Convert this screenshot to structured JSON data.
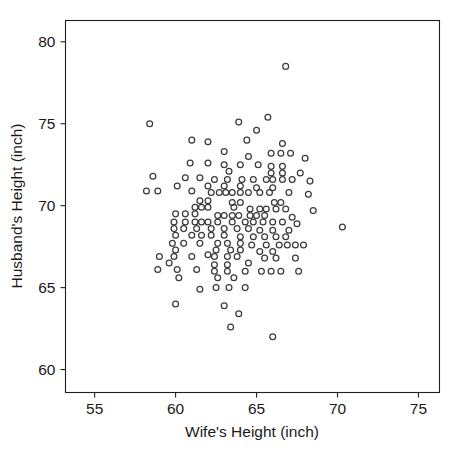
{
  "figure": {
    "clipped_header_text": "",
    "background_color": "#ffffff",
    "marker_color": "#3a3a40",
    "axis_color": "#1f1f1f"
  },
  "chart_data": {
    "type": "scatter",
    "title": "",
    "xlabel": "Wife's Height (inch)",
    "ylabel": "Husband's Height (inch)",
    "xlim": [
      53.2,
      76.3
    ],
    "ylim": [
      58.6,
      81.3
    ],
    "xticks": [
      55,
      60,
      65,
      70,
      75
    ],
    "yticks": [
      60,
      65,
      70,
      75,
      80
    ],
    "xtick_labels": [
      "55",
      "60",
      "65",
      "70",
      "75"
    ],
    "ytick_labels": [
      "60",
      "65",
      "70",
      "75",
      "80"
    ],
    "grid": false,
    "legend": null,
    "marker": "open-circle",
    "n_points": 169,
    "points": [
      [
        66.8,
        78.5
      ],
      [
        58.4,
        75.0
      ],
      [
        63.9,
        75.1
      ],
      [
        65.7,
        75.4
      ],
      [
        65.0,
        74.6
      ],
      [
        64.4,
        74.0
      ],
      [
        61.0,
        74.0
      ],
      [
        62.0,
        73.9
      ],
      [
        66.6,
        73.8
      ],
      [
        63.0,
        73.3
      ],
      [
        65.9,
        73.2
      ],
      [
        66.5,
        73.2
      ],
      [
        67.1,
        73.2
      ],
      [
        64.5,
        73.0
      ],
      [
        68.0,
        72.9
      ],
      [
        60.9,
        72.6
      ],
      [
        62.0,
        72.6
      ],
      [
        63.0,
        72.5
      ],
      [
        64.0,
        72.5
      ],
      [
        65.1,
        72.5
      ],
      [
        65.9,
        72.4
      ],
      [
        66.6,
        72.4
      ],
      [
        63.3,
        72.1
      ],
      [
        65.9,
        72.0
      ],
      [
        66.6,
        72.0
      ],
      [
        67.7,
        72.0
      ],
      [
        58.6,
        71.8
      ],
      [
        60.6,
        71.7
      ],
      [
        61.5,
        71.7
      ],
      [
        62.4,
        71.6
      ],
      [
        63.2,
        71.6
      ],
      [
        64.1,
        71.6
      ],
      [
        64.8,
        71.6
      ],
      [
        65.6,
        71.6
      ],
      [
        66.0,
        71.6
      ],
      [
        66.6,
        71.6
      ],
      [
        67.2,
        71.6
      ],
      [
        68.3,
        71.5
      ],
      [
        60.1,
        71.2
      ],
      [
        62.0,
        71.2
      ],
      [
        63.0,
        71.2
      ],
      [
        64.0,
        71.2
      ],
      [
        65.0,
        71.1
      ],
      [
        66.0,
        71.1
      ],
      [
        58.2,
        70.9
      ],
      [
        58.9,
        70.9
      ],
      [
        61.0,
        70.9
      ],
      [
        62.2,
        70.8
      ],
      [
        62.7,
        70.8
      ],
      [
        63.1,
        70.8
      ],
      [
        63.5,
        70.8
      ],
      [
        64.0,
        70.8
      ],
      [
        64.5,
        70.8
      ],
      [
        65.2,
        70.8
      ],
      [
        65.8,
        70.8
      ],
      [
        67.0,
        70.8
      ],
      [
        68.2,
        70.7
      ],
      [
        61.5,
        70.3
      ],
      [
        62.0,
        70.3
      ],
      [
        63.5,
        70.2
      ],
      [
        66.1,
        70.2
      ],
      [
        66.5,
        70.2
      ],
      [
        61.2,
        69.9
      ],
      [
        61.6,
        69.9
      ],
      [
        62.0,
        69.9
      ],
      [
        63.6,
        69.9
      ],
      [
        64.6,
        69.8
      ],
      [
        65.2,
        69.8
      ],
      [
        65.6,
        69.8
      ],
      [
        66.2,
        69.8
      ],
      [
        66.8,
        69.8
      ],
      [
        68.5,
        69.7
      ],
      [
        60.0,
        69.5
      ],
      [
        60.6,
        69.5
      ],
      [
        61.2,
        69.5
      ],
      [
        62.6,
        69.4
      ],
      [
        63.0,
        69.4
      ],
      [
        63.5,
        69.4
      ],
      [
        63.9,
        69.4
      ],
      [
        64.6,
        69.4
      ],
      [
        65.5,
        69.4
      ],
      [
        67.2,
        69.3
      ],
      [
        70.3,
        68.7
      ],
      [
        59.9,
        69.0
      ],
      [
        60.6,
        69.0
      ],
      [
        61.2,
        69.0
      ],
      [
        61.6,
        69.0
      ],
      [
        62.0,
        69.0
      ],
      [
        62.6,
        69.0
      ],
      [
        63.5,
        69.0
      ],
      [
        64.3,
        69.0
      ],
      [
        64.8,
        69.0
      ],
      [
        65.4,
        69.0
      ],
      [
        66.0,
        69.0
      ],
      [
        66.6,
        69.0
      ],
      [
        67.5,
        68.9
      ],
      [
        59.9,
        68.6
      ],
      [
        60.5,
        68.6
      ],
      [
        61.3,
        68.6
      ],
      [
        62.2,
        68.6
      ],
      [
        63.0,
        68.6
      ],
      [
        63.8,
        68.6
      ],
      [
        64.5,
        68.6
      ],
      [
        65.2,
        68.5
      ],
      [
        66.0,
        68.5
      ],
      [
        67.0,
        68.5
      ],
      [
        60.0,
        68.2
      ],
      [
        61.0,
        68.2
      ],
      [
        61.6,
        68.2
      ],
      [
        62.2,
        68.2
      ],
      [
        63.0,
        68.2
      ],
      [
        64.0,
        68.1
      ],
      [
        64.8,
        68.1
      ],
      [
        65.5,
        68.1
      ],
      [
        66.2,
        68.1
      ],
      [
        66.8,
        68.1
      ],
      [
        59.8,
        67.7
      ],
      [
        60.5,
        67.7
      ],
      [
        61.5,
        67.7
      ],
      [
        62.6,
        67.7
      ],
      [
        63.2,
        67.7
      ],
      [
        64.0,
        67.7
      ],
      [
        64.7,
        67.6
      ],
      [
        65.6,
        67.6
      ],
      [
        66.4,
        67.6
      ],
      [
        66.9,
        67.6
      ],
      [
        67.4,
        67.6
      ],
      [
        67.9,
        67.6
      ],
      [
        60.0,
        67.3
      ],
      [
        62.5,
        67.3
      ],
      [
        63.4,
        67.3
      ],
      [
        64.0,
        67.3
      ],
      [
        65.2,
        67.2
      ],
      [
        59.0,
        66.9
      ],
      [
        59.9,
        66.9
      ],
      [
        61.0,
        66.9
      ],
      [
        62.4,
        66.9
      ],
      [
        63.2,
        66.9
      ],
      [
        63.8,
        66.9
      ],
      [
        65.5,
        66.8
      ],
      [
        66.2,
        66.8
      ],
      [
        67.4,
        66.8
      ],
      [
        59.6,
        66.5
      ],
      [
        63.2,
        66.4
      ],
      [
        62.4,
        66.4
      ],
      [
        58.9,
        66.1
      ],
      [
        60.1,
        66.1
      ],
      [
        61.3,
        66.1
      ],
      [
        62.4,
        66.0
      ],
      [
        63.2,
        66.0
      ],
      [
        64.3,
        66.0
      ],
      [
        65.3,
        66.0
      ],
      [
        65.9,
        66.0
      ],
      [
        66.5,
        66.0
      ],
      [
        67.6,
        66.0
      ],
      [
        60.2,
        65.6
      ],
      [
        62.6,
        65.6
      ],
      [
        63.6,
        65.6
      ],
      [
        61.5,
        64.9
      ],
      [
        62.5,
        65.0
      ],
      [
        63.3,
        65.0
      ],
      [
        64.3,
        65.0
      ],
      [
        60.0,
        64.0
      ],
      [
        63.0,
        63.9
      ],
      [
        63.9,
        63.4
      ],
      [
        63.4,
        62.6
      ],
      [
        66.0,
        62.0
      ],
      [
        64.0,
        70.2
      ],
      [
        65.0,
        69.4
      ],
      [
        66.0,
        67.2
      ],
      [
        64.5,
        66.5
      ],
      [
        62.0,
        67.0
      ]
    ]
  }
}
